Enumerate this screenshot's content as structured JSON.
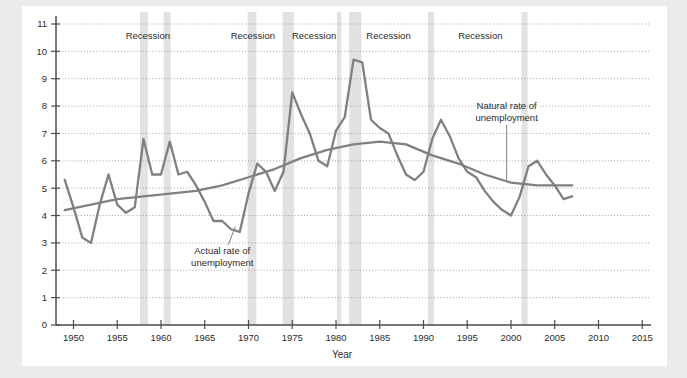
{
  "figure": {
    "background_color": "#eceaea",
    "panel_color": "#ffffff",
    "line_color": "#808080",
    "recession_band_color": "#e2e2e2",
    "grid_color": "#9a9a9a",
    "axis_color": "#4d4d4d"
  },
  "chart_data": {
    "type": "line",
    "title": "",
    "xlabel": "Year",
    "ylabel": "",
    "xlim": [
      1948,
      2016
    ],
    "ylim": [
      0,
      11
    ],
    "xticks": [
      1950,
      1955,
      1960,
      1965,
      1970,
      1975,
      1980,
      1985,
      1990,
      1995,
      2000,
      2005,
      2010,
      2015
    ],
    "xtick_labels": [
      "1950",
      "1955",
      "1960",
      "1965",
      "1970",
      "1975",
      "1980",
      "1985",
      "1990",
      "1995",
      "2000",
      "2005",
      "2010",
      "2015"
    ],
    "yticks": [
      0,
      1,
      2,
      3,
      4,
      5,
      6,
      7,
      8,
      9,
      10,
      11
    ],
    "ytick_labels": [
      "0",
      "1",
      "2",
      "3",
      "4",
      "5",
      "6",
      "7",
      "8",
      "9",
      "10",
      "11"
    ],
    "grid": "horizontal-dotted",
    "legend": "none",
    "series": [
      {
        "name": "Actual rate of unemployment",
        "x": [
          1949,
          1950,
          1951,
          1952,
          1953,
          1954,
          1955,
          1956,
          1957,
          1958,
          1959,
          1960,
          1961,
          1962,
          1963,
          1964,
          1965,
          1966,
          1967,
          1968,
          1969,
          1970,
          1971,
          1972,
          1973,
          1974,
          1975,
          1976,
          1977,
          1978,
          1979,
          1980,
          1981,
          1982,
          1983,
          1984,
          1985,
          1986,
          1987,
          1988,
          1989,
          1990,
          1991,
          1992,
          1993,
          1994,
          1995,
          1996,
          1997,
          1998,
          1999,
          2000,
          2001,
          2002,
          2003,
          2004,
          2005,
          2006,
          2007
        ],
        "y": [
          5.3,
          4.3,
          3.2,
          3.0,
          4.4,
          5.5,
          4.4,
          4.1,
          4.3,
          6.8,
          5.5,
          5.5,
          6.7,
          5.5,
          5.6,
          5.1,
          4.5,
          3.8,
          3.8,
          3.5,
          3.4,
          4.8,
          5.9,
          5.6,
          4.9,
          5.6,
          8.5,
          7.7,
          7.0,
          6.0,
          5.8,
          7.1,
          7.6,
          9.7,
          9.6,
          7.5,
          7.2,
          7.0,
          6.2,
          5.5,
          5.3,
          5.6,
          6.8,
          7.5,
          6.9,
          6.1,
          5.6,
          5.4,
          4.9,
          4.5,
          4.2,
          4.0,
          4.7,
          5.8,
          6.0,
          5.5,
          5.1,
          4.6,
          4.7
        ]
      },
      {
        "name": "Natural rate of unemployment",
        "x": [
          1949,
          1952,
          1955,
          1958,
          1961,
          1964,
          1967,
          1970,
          1973,
          1976,
          1979,
          1982,
          1985,
          1988,
          1991,
          1994,
          1997,
          2000,
          2003,
          2006,
          2007
        ],
        "y": [
          4.2,
          4.4,
          4.6,
          4.7,
          4.8,
          4.9,
          5.1,
          5.4,
          5.7,
          6.1,
          6.4,
          6.6,
          6.7,
          6.6,
          6.2,
          5.9,
          5.5,
          5.2,
          5.1,
          5.1,
          5.1
        ]
      }
    ],
    "recessions": [
      {
        "label": "Recession",
        "start": 1957.6,
        "end": 1958.5
      },
      {
        "label": "Recession",
        "start": 1960.3,
        "end": 1961.1
      },
      {
        "label": "Recession",
        "start": 1969.9,
        "end": 1970.9
      },
      {
        "label": "Recession",
        "start": 1973.9,
        "end": 1975.2
      },
      {
        "label": "Recession",
        "start": 1980.1,
        "end": 1980.6
      },
      {
        "label": "Recession",
        "start": 1981.5,
        "end": 1982.9
      },
      {
        "label": "Recession",
        "start": 1990.5,
        "end": 1991.2
      },
      {
        "label": "Recession",
        "start": 2001.2,
        "end": 2001.9
      }
    ],
    "recession_label_positions": [
      1958.5,
      1970.5,
      1977.5,
      1986.0,
      1996.5
    ],
    "annotations": [
      {
        "text_line1": "Actual rate of",
        "text_line2": "unemployment",
        "text_x": 1967.0,
        "text_y": 2.6,
        "leader_to_x": 1968.5,
        "leader_to_y": 3.6
      },
      {
        "text_line1": "Natural rate of",
        "text_line2": "unemployment",
        "text_x": 1999.5,
        "text_y": 7.9,
        "leader_to_x": 1999.5,
        "leader_to_y": 5.25
      }
    ]
  }
}
